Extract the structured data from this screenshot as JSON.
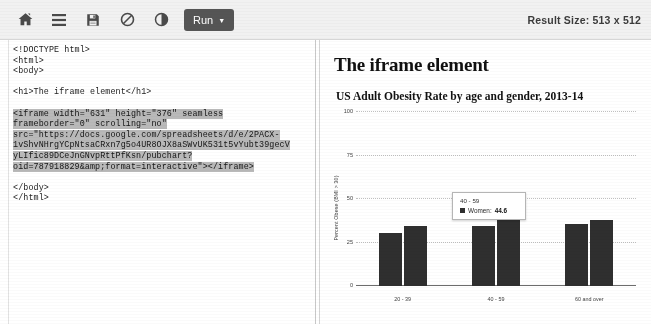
{
  "toolbar": {
    "icons": [
      {
        "name": "home-icon",
        "title": "Home"
      },
      {
        "name": "menu-icon",
        "title": "Menu"
      },
      {
        "name": "save-icon",
        "title": "Save"
      },
      {
        "name": "no-entry-icon",
        "title": "Disable"
      },
      {
        "name": "contrast-icon",
        "title": "Dark mode"
      }
    ],
    "run_label": "Run",
    "run_caret": "▼",
    "result_size_label": "Result Size: 513 x 512"
  },
  "editor": {
    "code_before": "<!DOCTYPE html>\n<html>\n<body>\n\n<h1>The iframe element</h1>\n\n",
    "code_selected": "<iframe width=\"631\" height=\"376\" seamless\nframeborder=\"0\" scrolling=\"no\"\nsrc=\"https://docs.google.com/spreadsheets/d/e/2PACX-\n1vShvNHrgYCpNtsaCRxn7g5o4UR8OJX8aSWvUK531t5vYubt39gecV\nyLIfic89DCeJnGNvpRttPfKsn/pubchart?\noid=787918829&amp;format=interactive\"></iframe>",
    "code_after": "\n\n</body>\n</html>\n"
  },
  "result": {
    "page_heading": "The iframe element"
  },
  "chart_data": {
    "type": "bar",
    "title": "US Adult Obesity Rate by age and gender, 2013-14",
    "xlabel": "",
    "ylabel": "Percent Obese (BMI > 30)",
    "categories": [
      "20 - 39",
      "40 - 59",
      "60 and over"
    ],
    "series": [
      {
        "name": "Men",
        "values": [
          30.3,
          34.3,
          35.5
        ]
      },
      {
        "name": "Women",
        "values": [
          34.4,
          44.6,
          38.1
        ]
      }
    ],
    "ylim": [
      0,
      100
    ],
    "yticks": [
      0,
      25,
      50,
      75,
      100
    ],
    "grid": true,
    "legend": "none",
    "tooltip": {
      "category": "40 - 59",
      "series": "Women",
      "value": "44.6",
      "separator": ": "
    }
  }
}
